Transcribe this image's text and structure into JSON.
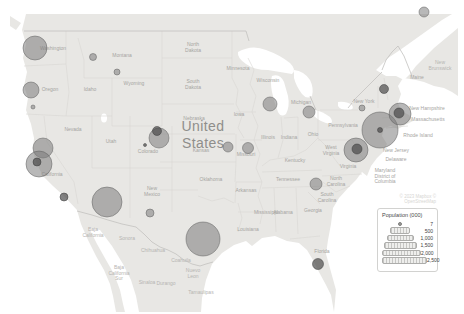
{
  "colors": {
    "land": "#e8e7e4",
    "water": "#ffffff",
    "bubble_fill": "#767676",
    "bubble_stroke": "#5e5e5e",
    "state_label": "#a6a5a2",
    "country_label": "#8f8e8b"
  },
  "map": {
    "country_label": {
      "line1": "United",
      "line2": "States"
    },
    "attribution": "© 2023 Mapbox © OpenStreetMap",
    "state_labels": [
      {
        "x": 53,
        "y": 50,
        "region": "us",
        "lines": [
          "Washington"
        ]
      },
      {
        "x": 50,
        "y": 91,
        "region": "us",
        "lines": [
          "Oregon"
        ]
      },
      {
        "x": 90,
        "y": 91,
        "region": "us",
        "lines": [
          "Idaho"
        ]
      },
      {
        "x": 122,
        "y": 57,
        "region": "us",
        "lines": [
          "Montana"
        ]
      },
      {
        "x": 134,
        "y": 85,
        "region": "us",
        "lines": [
          "Wyoming"
        ]
      },
      {
        "x": 73,
        "y": 131,
        "region": "us",
        "lines": [
          "Nevada"
        ]
      },
      {
        "x": 111,
        "y": 143,
        "region": "us",
        "lines": [
          "Utah"
        ]
      },
      {
        "x": 148,
        "y": 153,
        "region": "us",
        "lines": [
          "Colorado"
        ]
      },
      {
        "x": 52,
        "y": 176,
        "region": "us",
        "lines": [
          "California"
        ]
      },
      {
        "x": 152,
        "y": 190,
        "region": "us",
        "lines": [
          "New",
          "Mexico"
        ]
      },
      {
        "x": 193,
        "y": 46,
        "region": "us",
        "lines": [
          "North",
          "Dakota"
        ]
      },
      {
        "x": 193,
        "y": 83,
        "region": "us",
        "lines": [
          "South",
          "Dakota"
        ]
      },
      {
        "x": 194,
        "y": 120,
        "region": "us",
        "lines": [
          "Nebraska"
        ]
      },
      {
        "x": 201,
        "y": 152,
        "region": "us",
        "lines": [
          "Kansas"
        ]
      },
      {
        "x": 211,
        "y": 181,
        "region": "us",
        "lines": [
          "Oklahoma"
        ]
      },
      {
        "x": 238,
        "y": 70,
        "region": "us",
        "lines": [
          "Minnesota"
        ]
      },
      {
        "x": 239,
        "y": 116,
        "region": "us",
        "lines": [
          "Iowa"
        ]
      },
      {
        "x": 246,
        "y": 156,
        "region": "us",
        "lines": [
          "Missouri"
        ]
      },
      {
        "x": 246,
        "y": 192,
        "region": "us",
        "lines": [
          "Arkansas"
        ]
      },
      {
        "x": 248,
        "y": 231,
        "region": "us",
        "lines": [
          "Louisiana"
        ]
      },
      {
        "x": 268,
        "y": 82,
        "region": "us",
        "lines": [
          "Wisconsin"
        ]
      },
      {
        "x": 268,
        "y": 139,
        "region": "us",
        "lines": [
          "Illinois"
        ]
      },
      {
        "x": 301,
        "y": 104,
        "region": "us",
        "lines": [
          "Michigan"
        ]
      },
      {
        "x": 289,
        "y": 139,
        "region": "us",
        "lines": [
          "Indiana"
        ]
      },
      {
        "x": 313,
        "y": 136,
        "region": "us",
        "lines": [
          "Ohio"
        ]
      },
      {
        "x": 295,
        "y": 162,
        "region": "us",
        "lines": [
          "Kentucky"
        ]
      },
      {
        "x": 288,
        "y": 181,
        "region": "us",
        "lines": [
          "Tennessee"
        ]
      },
      {
        "x": 266,
        "y": 214,
        "region": "us",
        "lines": [
          "Mississippi"
        ]
      },
      {
        "x": 283,
        "y": 214,
        "region": "us",
        "lines": [
          "Alabama"
        ]
      },
      {
        "x": 313,
        "y": 212,
        "region": "us",
        "lines": [
          "Georgia"
        ]
      },
      {
        "x": 322,
        "y": 253,
        "region": "us",
        "lines": [
          "Florida"
        ]
      },
      {
        "x": 331,
        "y": 149,
        "region": "us",
        "lines": [
          "West",
          "Virginia"
        ]
      },
      {
        "x": 348,
        "y": 168,
        "region": "us",
        "lines": [
          "Virginia"
        ]
      },
      {
        "x": 336,
        "y": 180,
        "region": "us",
        "lines": [
          "North",
          "Carolina"
        ]
      },
      {
        "x": 327,
        "y": 196,
        "region": "us",
        "lines": [
          "South",
          "Carolina"
        ]
      },
      {
        "x": 343,
        "y": 127,
        "region": "us",
        "lines": [
          "Pennsylvania"
        ]
      },
      {
        "x": 364,
        "y": 103,
        "region": "us",
        "lines": [
          "New York"
        ]
      },
      {
        "x": 396,
        "y": 152,
        "region": "us",
        "lines": [
          "New Jersey"
        ]
      },
      {
        "x": 396,
        "y": 161,
        "region": "us",
        "lines": [
          "Delaware"
        ]
      },
      {
        "x": 385,
        "y": 172,
        "region": "us",
        "lines": [
          "Maryland",
          "District of",
          "Columbia"
        ]
      },
      {
        "x": 417,
        "y": 79,
        "region": "us",
        "lines": [
          "Maine"
        ]
      },
      {
        "x": 427,
        "y": 110,
        "region": "us",
        "lines": [
          "New Hampshire"
        ]
      },
      {
        "x": 428,
        "y": 121,
        "region": "us",
        "lines": [
          "Massachusetts"
        ]
      },
      {
        "x": 418,
        "y": 137,
        "region": "us",
        "lines": [
          "Rhode Island"
        ]
      },
      {
        "x": 93,
        "y": 231,
        "region": "mx",
        "lines": [
          "Baja",
          "California"
        ]
      },
      {
        "x": 127,
        "y": 240,
        "region": "mx",
        "lines": [
          "Sonora"
        ]
      },
      {
        "x": 153,
        "y": 252,
        "region": "mx",
        "lines": [
          "Chihuahua"
        ]
      },
      {
        "x": 181,
        "y": 262,
        "region": "mx",
        "lines": [
          "Coahuila"
        ]
      },
      {
        "x": 119,
        "y": 269,
        "region": "mx",
        "lines": [
          "Baja",
          "California",
          "Sur"
        ]
      },
      {
        "x": 147,
        "y": 284,
        "region": "mx",
        "lines": [
          "Sinaloa"
        ]
      },
      {
        "x": 166,
        "y": 285,
        "region": "mx",
        "lines": [
          "Durango"
        ]
      },
      {
        "x": 193,
        "y": 272,
        "region": "mx",
        "lines": [
          "Nuevo",
          "Leon"
        ]
      },
      {
        "x": 201,
        "y": 294,
        "region": "mx",
        "lines": [
          "Tamaulipas"
        ]
      },
      {
        "x": 440,
        "y": 64,
        "region": "ca",
        "lines": [
          "New",
          "Brunswick"
        ]
      }
    ]
  },
  "legend": {
    "title": "Population (000)",
    "min_symbol_label": "7",
    "rows": [
      {
        "label": "500",
        "width": 18
      },
      {
        "label": "1,000",
        "width": 25
      },
      {
        "label": "1,500",
        "width": 31
      },
      {
        "label": "2,000",
        "width": 37
      },
      {
        "label": "2,500",
        "width": 43
      }
    ]
  },
  "chart_data": {
    "type": "bubble_map",
    "title": "Population (000)",
    "size_legend_values": [
      7,
      500,
      1000,
      1500,
      2000,
      2500
    ],
    "legend_position": "bottom-right",
    "bubbles": [
      {
        "x": 35,
        "y": 48,
        "r": 12
      },
      {
        "x": 93,
        "y": 57,
        "r": 3.5
      },
      {
        "x": 117,
        "y": 72,
        "r": 3
      },
      {
        "x": 31,
        "y": 90,
        "r": 8
      },
      {
        "x": 33,
        "y": 107,
        "r": 2
      },
      {
        "x": 424,
        "y": 12,
        "r": 5
      },
      {
        "x": 43,
        "y": 148,
        "r": 10
      },
      {
        "x": 39,
        "y": 164,
        "r": 13
      },
      {
        "x": 37,
        "y": 162,
        "r": 4,
        "dark": true
      },
      {
        "x": 64,
        "y": 197,
        "r": 4,
        "dark": true
      },
      {
        "x": 107,
        "y": 202,
        "r": 15
      },
      {
        "x": 150,
        "y": 213,
        "r": 4
      },
      {
        "x": 159,
        "y": 138,
        "r": 10
      },
      {
        "x": 157,
        "y": 131,
        "r": 4.5,
        "dark": true
      },
      {
        "x": 145,
        "y": 145,
        "r": 1.5,
        "dark": true
      },
      {
        "x": 203,
        "y": 239,
        "r": 17
      },
      {
        "x": 270,
        "y": 104,
        "r": 7
      },
      {
        "x": 309,
        "y": 112,
        "r": 6
      },
      {
        "x": 228,
        "y": 147,
        "r": 5
      },
      {
        "x": 248,
        "y": 148,
        "r": 5.5
      },
      {
        "x": 316,
        "y": 184,
        "r": 6
      },
      {
        "x": 318,
        "y": 264,
        "r": 5.5,
        "dark": true
      },
      {
        "x": 362,
        "y": 108,
        "r": 3
      },
      {
        "x": 384,
        "y": 89,
        "r": 4.5,
        "dark": true
      },
      {
        "x": 380,
        "y": 130,
        "r": 18
      },
      {
        "x": 380,
        "y": 130,
        "r": 2.5,
        "dark": true
      },
      {
        "x": 400,
        "y": 114,
        "r": 11
      },
      {
        "x": 399,
        "y": 113,
        "r": 5,
        "dark": true
      },
      {
        "x": 356,
        "y": 150,
        "r": 12
      },
      {
        "x": 357,
        "y": 149,
        "r": 5,
        "dark": true
      }
    ]
  }
}
